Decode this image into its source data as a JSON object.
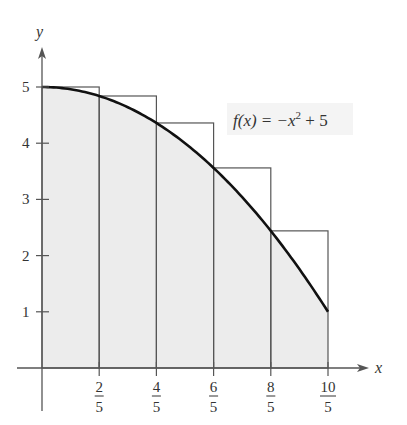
{
  "chart_data": {
    "type": "area",
    "title": "",
    "function": "f(x) = -x^2 + 5",
    "function_label": {
      "prefix": "f(x) = −x",
      "exponent": "2",
      "suffix": " + 5"
    },
    "xlabel": "x",
    "ylabel": "y",
    "xlim": [
      0,
      2
    ],
    "ylim": [
      0,
      5
    ],
    "x_ticks": [
      {
        "value": 0.4,
        "num": "2",
        "den": "5"
      },
      {
        "value": 0.8,
        "num": "4",
        "den": "5"
      },
      {
        "value": 1.2,
        "num": "6",
        "den": "5"
      },
      {
        "value": 1.6,
        "num": "8",
        "den": "5"
      },
      {
        "value": 2.0,
        "num": "10",
        "den": "5"
      }
    ],
    "y_ticks": [
      {
        "value": 1,
        "label": "1"
      },
      {
        "value": 2,
        "label": "2"
      },
      {
        "value": 3,
        "label": "3"
      },
      {
        "value": 4,
        "label": "4"
      },
      {
        "value": 5,
        "label": "5"
      }
    ],
    "rectangles": {
      "description": "Upper sum (left endpoints) with 5 subintervals of width 2/5",
      "width": 0.4,
      "items": [
        {
          "x0": 0.0,
          "x1": 0.4,
          "height": 5.0
        },
        {
          "x0": 0.4,
          "x1": 0.8,
          "height": 4.84
        },
        {
          "x0": 0.8,
          "x1": 1.2,
          "height": 4.36
        },
        {
          "x0": 1.2,
          "x1": 1.6,
          "height": 3.56
        },
        {
          "x0": 1.6,
          "x1": 2.0,
          "height": 2.44
        }
      ]
    },
    "curve_points": [
      {
        "x": 0.0,
        "y": 5.0
      },
      {
        "x": 0.4,
        "y": 4.84
      },
      {
        "x": 0.8,
        "y": 4.36
      },
      {
        "x": 1.2,
        "y": 3.56
      },
      {
        "x": 1.6,
        "y": 2.44
      },
      {
        "x": 2.0,
        "y": 1.0
      }
    ],
    "grid": false,
    "shaded_region": "area under curve from x=0 to x=2"
  },
  "colors": {
    "background": "#ffffff",
    "shade": "#ececec",
    "label_box": "#f4f4f4",
    "rect_stroke": "#555555",
    "curve": "#111111",
    "axis": "#555555"
  }
}
